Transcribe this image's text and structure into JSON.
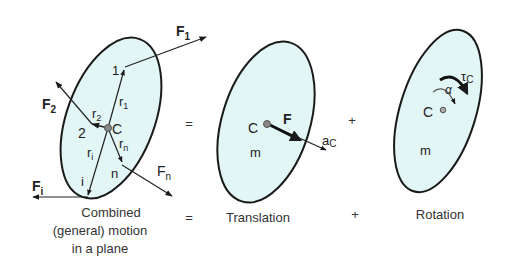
{
  "colors": {
    "body_fill": "#e3f6f6",
    "outline": "#1a1a1a",
    "text": "#222222"
  },
  "panel_general": {
    "forces": {
      "F1": {
        "main": "F",
        "sub": "1"
      },
      "F2": {
        "main": "F",
        "sub": "2"
      },
      "Fi": {
        "main": "F",
        "sub": "i"
      },
      "Fn": {
        "main": "F",
        "sub": "n"
      }
    },
    "vectors": {
      "r1": {
        "main": "r",
        "sub": "1"
      },
      "r2": {
        "main": "r",
        "sub": "2"
      },
      "ri": {
        "main": "r",
        "sub": "i"
      },
      "rn": {
        "main": "r",
        "sub": "n"
      }
    },
    "points": {
      "p1": "1",
      "p2": "2",
      "pi": "i",
      "pn": "n",
      "center": "C"
    },
    "caption_lines": [
      "Combined",
      "(general) motion",
      "in a plane"
    ]
  },
  "operator_equals_top": "=",
  "operator_equals_bottom": "=",
  "operator_plus_top": "+",
  "operator_plus_bottom": "+",
  "panel_translation": {
    "center": "C",
    "mass": "m",
    "force": "F",
    "accel": {
      "main": "a",
      "sub": "C"
    },
    "caption": "Translation"
  },
  "panel_rotation": {
    "center": "C",
    "mass": "m",
    "torque": {
      "main": "τ",
      "sub": "C"
    },
    "angular_accel": "α",
    "caption": "Rotation"
  }
}
